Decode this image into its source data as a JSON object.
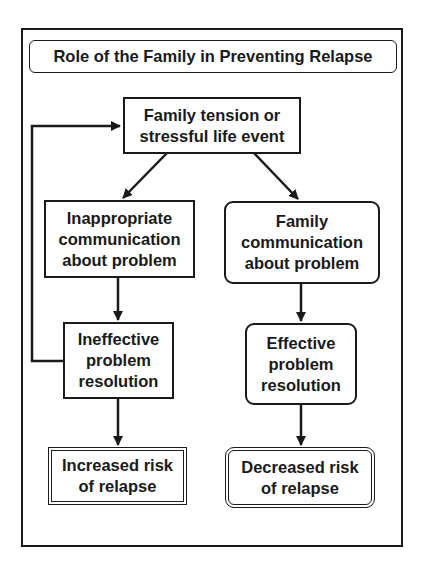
{
  "diagram": {
    "title": "Role of the Family in Preventing Relapse",
    "nodes": {
      "trigger": "Family tension or\nstressful life event",
      "inappropriate_comm": "Inappropriate\ncommunication\nabout problem",
      "family_comm": "Family\ncommunication\nabout problem",
      "ineffective_resolution": "Ineffective\nproblem\nresolution",
      "effective_resolution": "Effective\nproblem\nresolution",
      "increased_risk": "Increased risk\nof relapse",
      "decreased_risk": "Decreased risk\nof relapse"
    },
    "edges": [
      {
        "from": "trigger",
        "to": "inappropriate_comm"
      },
      {
        "from": "trigger",
        "to": "family_comm"
      },
      {
        "from": "inappropriate_comm",
        "to": "ineffective_resolution"
      },
      {
        "from": "family_comm",
        "to": "effective_resolution"
      },
      {
        "from": "ineffective_resolution",
        "to": "increased_risk"
      },
      {
        "from": "effective_resolution",
        "to": "decreased_risk"
      },
      {
        "from": "ineffective_resolution",
        "to": "trigger",
        "type": "feedback"
      }
    ]
  }
}
